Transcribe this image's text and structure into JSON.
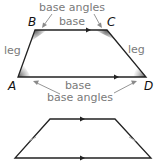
{
  "diagram": {
    "colors": {
      "line": "#222222",
      "label": "#7a7a7a",
      "arrow": "#8a8a8a",
      "angle_shade": "#555555",
      "tick": "#aaaaaa"
    },
    "top_trapezoid": {
      "vertices": {
        "A": "A",
        "B": "B",
        "C": "C",
        "D": "D"
      },
      "labels": {
        "top_base_angles": "base angles",
        "top_base": "base",
        "left_leg": "leg",
        "right_leg": "leg",
        "bottom_base": "base",
        "bottom_base_angles": "base angles"
      }
    },
    "bottom_trapezoid": {
      "description": "isosceles trapezoid with parallel-base arrows and congruent leg tick marks"
    }
  }
}
